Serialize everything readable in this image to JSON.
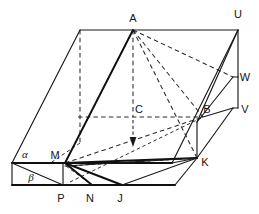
{
  "figure": {
    "width": 259,
    "height": 214,
    "background_color": "#ffffff",
    "line_color": "#1a1a1a",
    "label_color": "#151515"
  },
  "labels": [
    {
      "id": "A",
      "text": "A",
      "x": 133,
      "y": 22,
      "kind": "latin"
    },
    {
      "id": "U",
      "text": "U",
      "x": 238,
      "y": 18,
      "kind": "latin"
    },
    {
      "id": "W",
      "text": "W",
      "x": 243,
      "y": 81,
      "kind": "latin"
    },
    {
      "id": "V",
      "text": "V",
      "x": 243,
      "y": 113,
      "kind": "latin"
    },
    {
      "id": "C",
      "text": "C",
      "x": 137,
      "y": 112,
      "kind": "latin"
    },
    {
      "id": "B",
      "text": "B",
      "x": 206,
      "y": 112,
      "kind": "latin"
    },
    {
      "id": "K",
      "text": "K",
      "x": 203,
      "y": 165,
      "kind": "latin"
    },
    {
      "id": "M",
      "text": "M",
      "x": 55,
      "y": 158,
      "kind": "latin"
    },
    {
      "id": "P",
      "text": "P",
      "x": 58,
      "y": 202,
      "kind": "latin"
    },
    {
      "id": "N",
      "text": "N",
      "x": 87,
      "y": 202,
      "kind": "latin"
    },
    {
      "id": "J",
      "text": "J",
      "x": 118,
      "y": 202,
      "kind": "latin"
    },
    {
      "id": "alpha",
      "text": "α",
      "x": 23,
      "y": 158,
      "kind": "greek"
    },
    {
      "id": "beta",
      "text": "β",
      "x": 29,
      "y": 180,
      "kind": "greek"
    }
  ],
  "points": {
    "A": [
      133,
      30
    ],
    "U": [
      238,
      30
    ],
    "TL": [
      80,
      30
    ],
    "W": [
      233,
      77
    ],
    "V": [
      233,
      108
    ],
    "C": [
      133,
      117
    ],
    "B": [
      203,
      117
    ],
    "M": [
      65,
      163
    ],
    "K": [
      197,
      158
    ],
    "P": [
      63,
      185
    ],
    "N": [
      92,
      185
    ],
    "J": [
      122,
      185
    ],
    "AL": [
      12,
      163
    ],
    "BL": [
      12,
      185
    ],
    "RF": [
      200,
      142
    ],
    "RB": [
      175,
      185
    ],
    "arrow_tip": [
      133,
      145
    ]
  },
  "annotations": {
    "arrow_note": "vertical dashed arrow from C pointing downward",
    "plane_alpha": "α",
    "plane_beta": "β"
  }
}
